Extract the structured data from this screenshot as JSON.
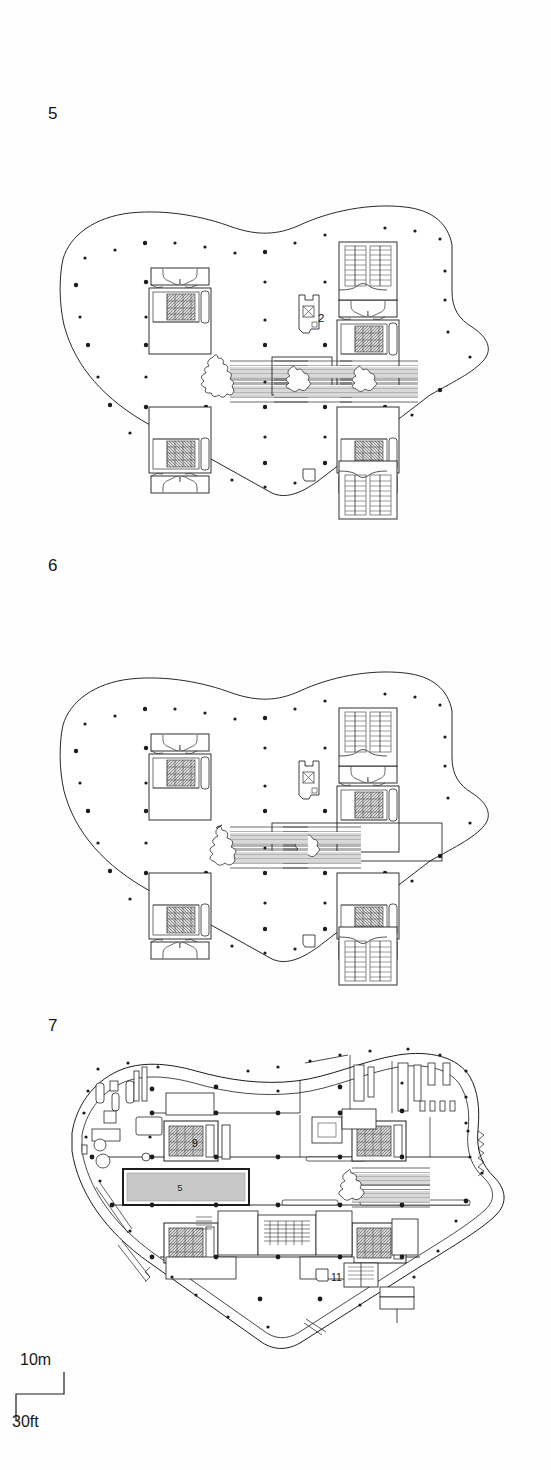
{
  "document": {
    "type": "architectural-floor-plans",
    "sheet_background": "#ffffff",
    "ink_color": "#1c1c1c",
    "pool_fill": "#c9c9c9",
    "core_hatch_fill": "#9a9a9a"
  },
  "plans": [
    {
      "id": "plan-5",
      "label": "5",
      "description": "Typical upper office floor level 5 with four service cores and central escalators",
      "annotations": [
        {
          "id": "ann-2",
          "text": "2",
          "x": 318,
          "y": 222
        }
      ]
    },
    {
      "id": "plan-6",
      "label": "6",
      "description": "Typical upper office floor level 6 with four service cores, central escalators and extended void",
      "annotations": []
    },
    {
      "id": "plan-7",
      "label": "7",
      "description": "Level 7 roof terrace level with pool, perimeter walkway and partitioned interior",
      "annotations": [
        {
          "id": "ann-9",
          "text": "9",
          "x": 192,
          "y": 138
        },
        {
          "id": "ann-5-pool",
          "text": "5",
          "x": 180,
          "y": 188
        },
        {
          "id": "ann-11",
          "text": "11",
          "x": 331,
          "y": 272
        }
      ]
    }
  ],
  "scale_bar": {
    "metric_label": "10m",
    "imperial_label": "30ft"
  }
}
